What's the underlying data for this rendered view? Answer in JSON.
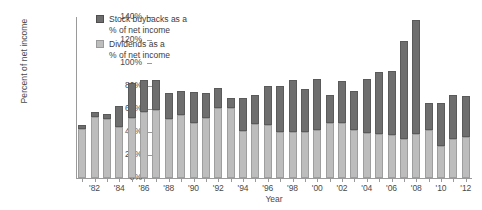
{
  "chart_data": {
    "type": "bar",
    "title": "",
    "subtitle": "",
    "xlabel": "Year",
    "ylabel": "Percent of net income",
    "ylim": [
      0,
      140
    ],
    "ytick_values": [
      0,
      20,
      40,
      60,
      80,
      100,
      120,
      140
    ],
    "ytick_labels": [
      "0%",
      "20%",
      "40%",
      "60%",
      "80%",
      "100%",
      "120%",
      "140%"
    ],
    "grid": false,
    "stacked": true,
    "legend_position": "top-left",
    "legend": [
      {
        "name": "Stock buybacks as a % of net income",
        "line1": "Stock buybacks as a",
        "line2": "% of net income",
        "color": "#6e6e6e"
      },
      {
        "name": "Dividends as a % of net income",
        "line1": "Dividends as a",
        "line2": "% of net income",
        "color": "#bdbdbd"
      }
    ],
    "categories": [
      "1981",
      "1982",
      "1983",
      "1984",
      "1985",
      "1986",
      "1987",
      "1988",
      "1989",
      "1990",
      "1991",
      "1992",
      "1993",
      "1994",
      "1995",
      "1996",
      "1997",
      "1998",
      "1999",
      "2000",
      "2001",
      "2002",
      "2003",
      "2004",
      "2005",
      "2006",
      "2007",
      "2008",
      "2009",
      "2010",
      "2011",
      "2012"
    ],
    "xtick_labels": [
      "'82",
      "'84",
      "'86",
      "'88",
      "'90",
      "'92",
      "'94",
      "'96",
      "'98",
      "'00",
      "'02",
      "'04",
      "'06",
      "'08",
      "'10",
      "'12"
    ],
    "xtick_categories": [
      "1982",
      "1984",
      "1986",
      "1988",
      "1990",
      "1992",
      "1994",
      "1996",
      "1998",
      "2000",
      "2002",
      "2004",
      "2006",
      "2008",
      "2010",
      "2012"
    ],
    "series": [
      {
        "name": "Dividends as a % of net income",
        "color": "#bdbdbd",
        "values": [
          43,
          53,
          51,
          44,
          52,
          57,
          59,
          51,
          55,
          48,
          52,
          61,
          61,
          41,
          47,
          46,
          40,
          40,
          40,
          42,
          48,
          48,
          42,
          39,
          38,
          37,
          34,
          38,
          42,
          28,
          34,
          36
        ]
      },
      {
        "name": "Stock buybacks as a % of net income",
        "color": "#6e6e6e",
        "values": [
          3,
          4,
          5,
          19,
          31,
          28,
          26,
          23,
          21,
          27,
          22,
          17,
          9,
          29,
          25,
          34,
          40,
          45,
          37,
          44,
          24,
          36,
          34,
          47,
          54,
          56,
          85,
          99,
          23,
          37,
          38,
          35
        ]
      }
    ],
    "totals": [
      46,
      57,
      56,
      63,
      83,
      85,
      85,
      74,
      76,
      75,
      74,
      78,
      70,
      70,
      72,
      80,
      80,
      85,
      77,
      86,
      72,
      84,
      76,
      86,
      92,
      93,
      119,
      137,
      65,
      65,
      72,
      71
    ]
  }
}
